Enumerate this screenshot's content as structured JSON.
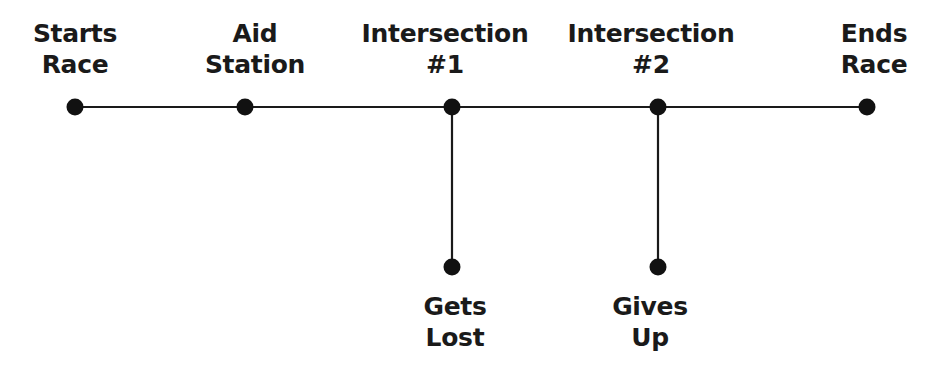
{
  "diagram": {
    "type": "flow-timeline",
    "line_color": "#1a1a1a",
    "node_color": "#111111",
    "main_line": {
      "y": 107,
      "x_start": 75,
      "x_end": 867
    },
    "nodes": [
      {
        "id": "starts-race",
        "lines": [
          "Starts",
          "Race"
        ],
        "x": 75,
        "y": 107,
        "label_pos": "above",
        "label_x": 75,
        "label_y": 18
      },
      {
        "id": "aid-station",
        "lines": [
          "Aid",
          "Station"
        ],
        "x": 245,
        "y": 107,
        "label_pos": "above",
        "label_x": 255,
        "label_y": 18
      },
      {
        "id": "intersection-1",
        "lines": [
          "Intersection",
          "#1"
        ],
        "x": 452,
        "y": 107,
        "label_pos": "above",
        "label_x": 445,
        "label_y": 18
      },
      {
        "id": "intersection-2",
        "lines": [
          "Intersection",
          "#2"
        ],
        "x": 658,
        "y": 107,
        "label_pos": "above",
        "label_x": 651,
        "label_y": 18
      },
      {
        "id": "ends-race",
        "lines": [
          "Ends",
          "Race"
        ],
        "x": 867,
        "y": 107,
        "label_pos": "above",
        "label_x": 874,
        "label_y": 18
      },
      {
        "id": "gets-lost",
        "lines": [
          "Gets",
          "Lost"
        ],
        "x": 452,
        "y": 267,
        "label_pos": "below",
        "label_x": 455,
        "label_y": 291
      },
      {
        "id": "gives-up",
        "lines": [
          "Gives",
          "Up"
        ],
        "x": 658,
        "y": 267,
        "label_pos": "below",
        "label_x": 650,
        "label_y": 291
      }
    ],
    "edges": [
      {
        "from": "starts-race",
        "to": "aid-station"
      },
      {
        "from": "aid-station",
        "to": "intersection-1"
      },
      {
        "from": "intersection-1",
        "to": "intersection-2"
      },
      {
        "from": "intersection-2",
        "to": "ends-race"
      },
      {
        "from": "intersection-1",
        "to": "gets-lost"
      },
      {
        "from": "intersection-2",
        "to": "gives-up"
      }
    ]
  }
}
